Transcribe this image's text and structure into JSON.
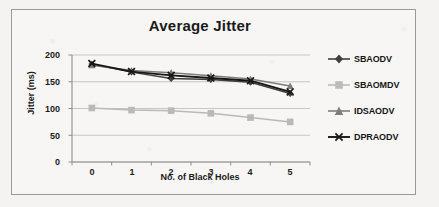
{
  "chart_data": {
    "type": "line",
    "title": "Average Jitter",
    "xlabel": "No. of Black Holes",
    "ylabel": "Jitter (ms)",
    "categories": [
      "0",
      "1",
      "2",
      "3",
      "4",
      "5"
    ],
    "x": [
      0,
      1,
      2,
      3,
      4,
      5
    ],
    "ylim": [
      0,
      200
    ],
    "yticks": [
      "0",
      "50",
      "100",
      "150",
      "200"
    ],
    "ytick_values": [
      0,
      50,
      100,
      150,
      200
    ],
    "grid": "horizontal",
    "legend_position": "right",
    "series": [
      {
        "name": "SBAODV",
        "marker": "diamond",
        "color": "#3f3f3f",
        "values": [
          183,
          168,
          156,
          154,
          149,
          128
        ]
      },
      {
        "name": "SBAOMDV",
        "marker": "square",
        "color": "#b9b9b9",
        "values": [
          101,
          97,
          96,
          91,
          83,
          75
        ]
      },
      {
        "name": "IDSAODV",
        "marker": "triangle",
        "color": "#7d7d7d",
        "values": [
          181,
          171,
          167,
          161,
          155,
          142
        ]
      },
      {
        "name": "DPRAODV",
        "marker": "cross",
        "color": "#171717",
        "values": [
          184,
          169,
          162,
          157,
          152,
          131
        ]
      }
    ]
  },
  "legend": {
    "items": [
      {
        "label": "SBAODV"
      },
      {
        "label": "SBAOMDV"
      },
      {
        "label": "IDSAODV"
      },
      {
        "label": "DPRAODV"
      }
    ]
  },
  "axes": {
    "y_tick_labels": [
      "200",
      "150",
      "100",
      "50",
      "0"
    ],
    "x_tick_labels": [
      "0",
      "1",
      "2",
      "3",
      "4",
      "5"
    ]
  },
  "colors": {
    "page_background": "#f4f3f1",
    "frame_border": "#9a9a9a",
    "gridline": "#c6c6c6",
    "axis": "#8e8e8e",
    "text": "#1b1b1b"
  }
}
